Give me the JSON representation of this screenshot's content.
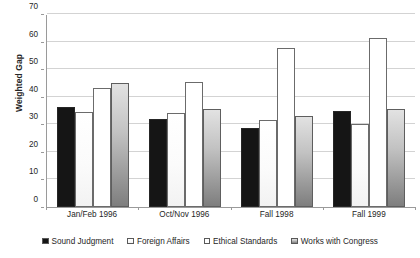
{
  "chart_data": {
    "type": "bar",
    "title": "",
    "subtitle": "",
    "xlabel": "",
    "ylabel": "Weighted Gap",
    "ylim": [
      0,
      70
    ],
    "yticks": [
      0,
      10,
      20,
      30,
      40,
      50,
      60,
      70
    ],
    "grid": true,
    "legend_position": "bottom",
    "categories": [
      "Jan/Feb 1996",
      "Oct/Nov 1996",
      "Fall 1998",
      "Fall 1999"
    ],
    "series": [
      {
        "name": "Sound Judgment",
        "color": "#151515",
        "swatch": "filled-black-square",
        "values": [
          36.3,
          32,
          28.5,
          35
        ]
      },
      {
        "name": "Foreign Affairs",
        "color": "#fbfbfb",
        "swatch": "outlined-white-square",
        "values": [
          34.6,
          34,
          31.5,
          30
        ]
      },
      {
        "name": "Ethical Standards",
        "color": "#ffffff",
        "swatch": "outlined-white-square",
        "values": [
          43,
          45.5,
          57.5,
          61.3
        ]
      },
      {
        "name": "Works with Congress",
        "color": "#b4b4b4",
        "swatch": "gray-square",
        "values": [
          45,
          35.5,
          33,
          35.5
        ]
      }
    ]
  },
  "axis": {
    "ylabel": "Weighted Gap",
    "tick_labels": [
      "70",
      "60",
      "50",
      "40",
      "30",
      "20",
      "10",
      "0"
    ]
  },
  "colors": {
    "grid": "#d3d3d3",
    "axis": "#9a9a9a",
    "text": "#262626",
    "background": "#ffffff"
  }
}
